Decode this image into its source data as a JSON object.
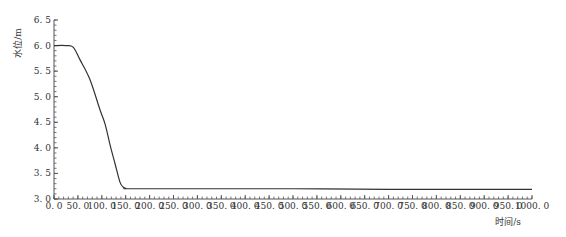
{
  "chart_data": {
    "type": "line",
    "title": "",
    "xlabel": "时间/s",
    "ylabel": "水位/m",
    "xlim": [
      0,
      1000
    ],
    "ylim": [
      3.0,
      6.5
    ],
    "grid": false,
    "legend": null,
    "x_ticks": [
      "0.0",
      "50.0",
      "100.0",
      "150.0",
      "200.0",
      "250.0",
      "300.0",
      "350.0",
      "400.0",
      "450.0",
      "500.0",
      "550.0",
      "600.0",
      "650.0",
      "700.0",
      "750.0",
      "800.0",
      "850.0",
      "900.0",
      "950.0",
      "1000.0"
    ],
    "y_ticks": [
      "3.0",
      "3.5",
      "4.0",
      "4.5",
      "5.0",
      "5.5",
      "6.0",
      "6.5"
    ],
    "series": [
      {
        "name": "水位",
        "color": "#333333",
        "x": [
          0,
          25,
          40,
          54,
          75,
          96,
          107,
          117,
          128,
          138,
          145,
          150,
          160,
          300,
          500,
          700,
          1000
        ],
        "y": [
          6.0,
          6.0,
          5.97,
          5.73,
          5.34,
          4.75,
          4.46,
          4.07,
          3.68,
          3.33,
          3.23,
          3.21,
          3.2,
          3.2,
          3.2,
          3.19,
          3.19
        ]
      }
    ]
  }
}
